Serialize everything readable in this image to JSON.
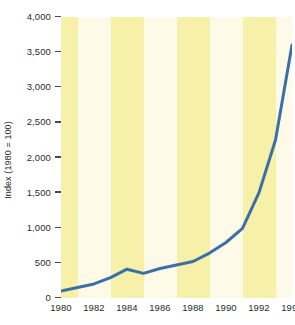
{
  "chart_data": {
    "type": "line",
    "title": "",
    "subtitle": "",
    "xlabel": "",
    "ylabel": "Index (1980 = 100)",
    "xlim": [
      1980,
      1994
    ],
    "ylim": [
      0,
      4000
    ],
    "grid": false,
    "legend": false,
    "legend_position": "none",
    "annotations": [],
    "y_ticks": [
      "0",
      "500",
      "1,000",
      "1,500",
      "2,000",
      "2,500",
      "3,000",
      "3,500",
      "4,000"
    ],
    "y_tick_values": [
      0,
      500,
      1000,
      1500,
      2000,
      2500,
      3000,
      3500,
      4000
    ],
    "x_ticks": [
      "1980",
      "1982",
      "1984",
      "1986",
      "1988",
      "1990",
      "1992",
      "1994"
    ],
    "x_tick_values": [
      1980,
      1982,
      1984,
      1986,
      1988,
      1990,
      1992,
      1994
    ],
    "x": [
      1980,
      1981,
      1982,
      1983,
      1984,
      1985,
      1986,
      1987,
      1988,
      1989,
      1990,
      1991,
      1992,
      1993,
      1994
    ],
    "values": [
      100,
      150,
      200,
      290,
      410,
      350,
      420,
      470,
      520,
      640,
      790,
      990,
      1500,
      2250,
      3600
    ],
    "series": [
      {
        "name": "Index (1980 = 100)",
        "color": "#3a6fa8",
        "values": [
          100,
          150,
          200,
          290,
          410,
          350,
          420,
          470,
          520,
          640,
          790,
          990,
          1500,
          2250,
          3600
        ]
      }
    ],
    "band_colors": [
      "#f6f0a9",
      "#fdfbe8"
    ],
    "band_span_years": 2,
    "line_color": "#3a6fa8",
    "line_width": 3,
    "background_color": "#ffffff",
    "text_color": "#2b2b2b"
  }
}
